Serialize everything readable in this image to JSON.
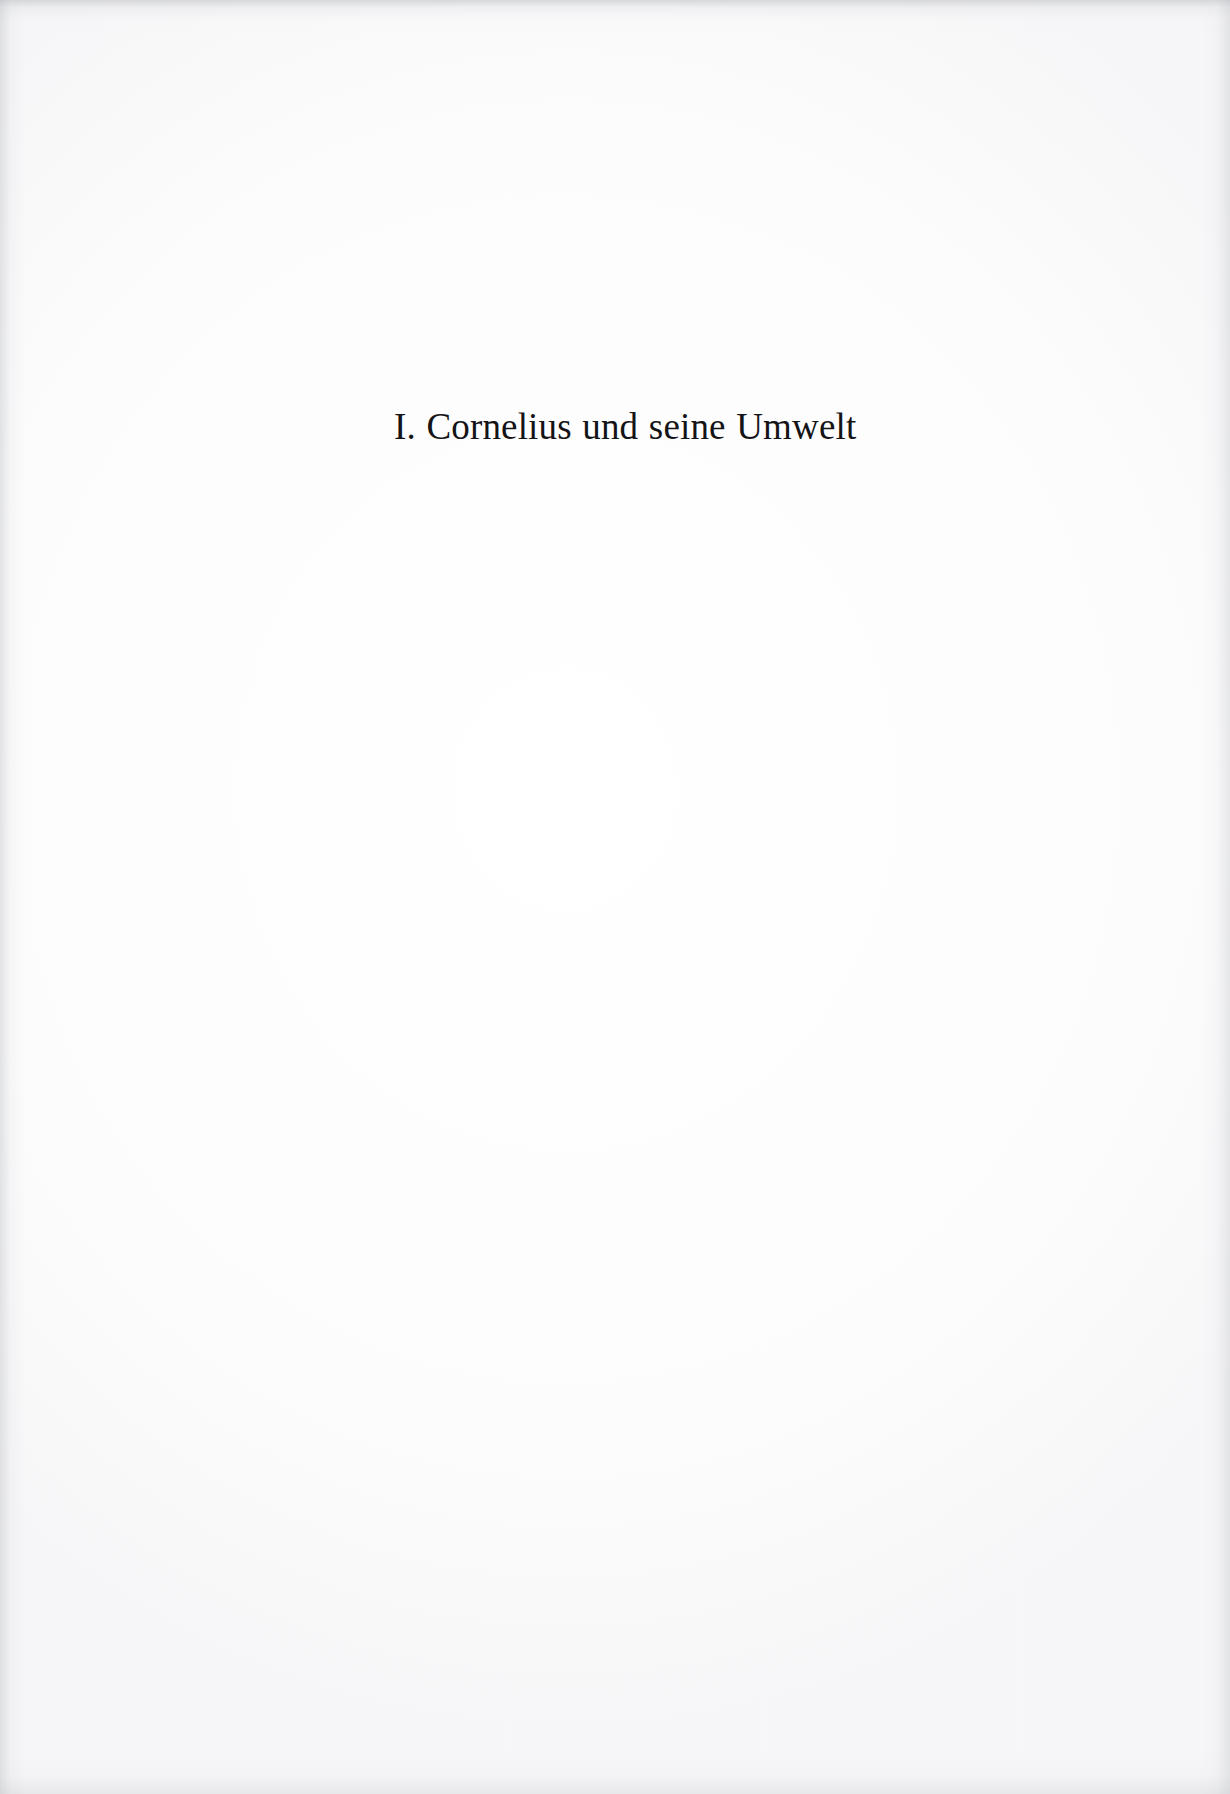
{
  "document": {
    "type": "scanned-book-page",
    "page_kind": "section-title-page",
    "background_color": "#ffffff",
    "text_color": "#141417"
  },
  "heading": {
    "number": "I.",
    "title": "Cornelius und seine Umwelt",
    "full_text": "I. Cornelius und seine Umwelt",
    "language": "de"
  },
  "body": {
    "content": ""
  }
}
